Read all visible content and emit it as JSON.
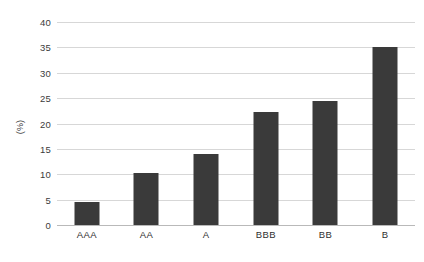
{
  "chart_data": {
    "type": "bar",
    "title": "",
    "xlabel": "",
    "ylabel": "(%)",
    "categories": [
      "AAA",
      "AA",
      "A",
      "BBB",
      "BB",
      "B"
    ],
    "values": [
      4.6,
      10.2,
      14.0,
      22.2,
      24.5,
      35.0
    ],
    "ylim": [
      0,
      40
    ],
    "ytick_labels": [
      "0",
      "5",
      "10",
      "15",
      "20",
      "25",
      "30",
      "35",
      "40"
    ],
    "ytick_values": [
      0,
      5,
      10,
      15,
      20,
      25,
      30,
      35,
      40
    ],
    "grid": true,
    "legend": false,
    "bar_color": "#3a3a3a",
    "gridline_color": "#d7d7d7",
    "axis_color": "#b9b9b9",
    "background_color": "#ffffff"
  }
}
